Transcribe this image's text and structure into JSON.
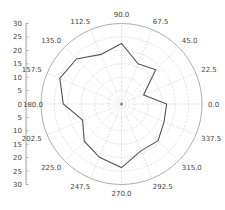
{
  "chart_data": {
    "type": "polar-line",
    "title": "",
    "angle_unit": "degrees",
    "angles": [
      0,
      22.5,
      45,
      67.5,
      90,
      112.5,
      135,
      157.5,
      180,
      202.5,
      225,
      247.5,
      270,
      292.5,
      315,
      337.5
    ],
    "angle_labels": [
      "0.0",
      "22.5",
      "45.0",
      "67.5",
      "90.0",
      "112.5",
      "135.0",
      "157.5",
      "180.0",
      "202.5",
      "225.0",
      "247.5",
      "270.0",
      "292.5",
      "315.0",
      "337.5"
    ],
    "series": [
      {
        "name": "series-1",
        "closed": true,
        "values": [
          16.8,
          8.9,
          18.0,
          16.2,
          22.6,
          20.0,
          23.7,
          24.9,
          21.7,
          15.7,
          19.6,
          21.5,
          23.7,
          18.9,
          19.3,
          17.2
        ]
      }
    ],
    "radial_range": [
      0,
      30
    ],
    "radial_ticks": [
      0,
      5,
      10,
      15,
      20,
      25,
      30
    ],
    "radial_axis_labels_top": [
      "30",
      "25",
      "20",
      "15",
      "10",
      "5",
      "0"
    ],
    "radial_axis_labels_bottom": [
      "5",
      "10",
      "15",
      "20",
      "25",
      "30"
    ],
    "grid": true,
    "colors": {
      "line": "#555555",
      "grid": "#cccccc",
      "outer_ring": "#999999",
      "axis": "#888888",
      "text": "#444444"
    }
  }
}
